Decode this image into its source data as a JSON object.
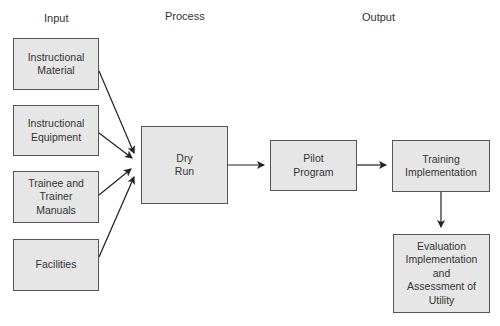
{
  "column_labels": {
    "input": "Input",
    "process": "Process",
    "output": "Output"
  },
  "nodes": {
    "instructional_material": "Instructional\nMaterial",
    "instructional_equipment": "Instructional\nEquipment",
    "trainee_manuals": "Trainee and\nTrainer\nManuals",
    "facilities": "Facilities",
    "dry_run": "Dry\nRun",
    "pilot_program": "Pilot\nProgram",
    "training_implementation": "Training\nImplementation",
    "evaluation": "Evaluation\nImplementation\nand\nAssessment of\nUtility"
  },
  "edges": [
    {
      "from": "instructional_material",
      "to": "dry_run"
    },
    {
      "from": "instructional_equipment",
      "to": "dry_run"
    },
    {
      "from": "trainee_manuals",
      "to": "dry_run"
    },
    {
      "from": "facilities",
      "to": "dry_run"
    },
    {
      "from": "dry_run",
      "to": "pilot_program"
    },
    {
      "from": "pilot_program",
      "to": "training_implementation"
    },
    {
      "from": "training_implementation",
      "to": "evaluation"
    }
  ],
  "colors": {
    "box_fill": "#e6e6e6",
    "box_border": "#555555",
    "arrow": "#222222"
  }
}
